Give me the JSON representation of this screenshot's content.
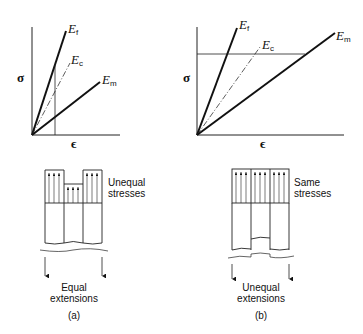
{
  "panels": [
    {
      "id": "a",
      "caption": "(a)",
      "graph": {
        "y_axis_label": "σ",
        "x_axis_label": "ϵ",
        "lines": [
          {
            "symbol": "E",
            "subscript": "f",
            "style": "solid-thick"
          },
          {
            "symbol": "E",
            "subscript": "c",
            "style": "dash-dot"
          },
          {
            "symbol": "E",
            "subscript": "m",
            "style": "solid-thick"
          }
        ],
        "guide": "vertical line at constant strain"
      },
      "block": {
        "stress_label_line1": "Unequal",
        "stress_label_line2": "stresses",
        "extension_label_line1": "Equal",
        "extension_label_line2": "extensions"
      }
    },
    {
      "id": "b",
      "caption": "(b)",
      "graph": {
        "y_axis_label": "σ",
        "x_axis_label": "ϵ",
        "lines": [
          {
            "symbol": "E",
            "subscript": "f",
            "style": "solid-thick"
          },
          {
            "symbol": "E",
            "subscript": "c",
            "style": "dash-dot"
          },
          {
            "symbol": "E",
            "subscript": "m",
            "style": "solid-thick"
          }
        ],
        "guide": "horizontal line at constant stress"
      },
      "block": {
        "stress_label_line1": "Same",
        "stress_label_line2": "stresses",
        "extension_label_line1": "Unequal",
        "extension_label_line2": "extensions"
      }
    }
  ]
}
